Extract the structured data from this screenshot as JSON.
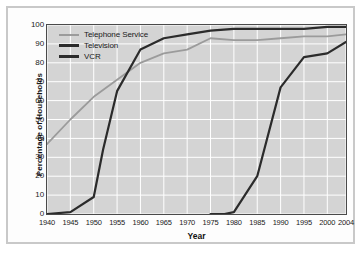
{
  "chart_data": {
    "type": "line",
    "title": "",
    "xlabel": "Year",
    "ylabel": "Percentage of Households",
    "xlim": [
      1940,
      2004
    ],
    "ylim": [
      0,
      100
    ],
    "grid": true,
    "legend_position": "top-left inside plot",
    "x_ticks": [
      "1940",
      "1945",
      "1950",
      "1955",
      "1960",
      "1965",
      "1970",
      "1975",
      "1980",
      "1985",
      "1990",
      "1995",
      "2000",
      "2004"
    ],
    "y_ticks": [
      "0",
      "10",
      "20",
      "30",
      "40",
      "50",
      "60",
      "70",
      "80",
      "90",
      "100"
    ],
    "x": [
      1940,
      1945,
      1950,
      1955,
      1960,
      1965,
      1970,
      1975,
      1980,
      1985,
      1990,
      1995,
      2000,
      2004
    ],
    "series": [
      {
        "name": "Telephone Service",
        "color": "#9b9b9b",
        "width": 1.8,
        "x": [
          1940,
          1945,
          1950,
          1955,
          1960,
          1965,
          1970,
          1975,
          1980,
          1985,
          1990,
          1995,
          2000,
          2004
        ],
        "values": [
          37,
          50,
          62,
          71,
          80,
          85,
          87,
          93,
          92,
          92,
          93,
          94,
          94,
          95
        ]
      },
      {
        "name": "Television",
        "color": "#2b2b2b",
        "width": 2.2,
        "x": [
          1940,
          1945,
          1950,
          1952,
          1955,
          1960,
          1965,
          1970,
          1975,
          1980,
          1985,
          1990,
          1995,
          2000,
          2004
        ],
        "values": [
          0,
          1,
          9,
          34,
          65,
          87,
          93,
          95,
          97,
          98,
          98,
          98,
          98,
          99,
          99
        ]
      },
      {
        "name": "VCR",
        "color": "#2b2b2b",
        "width": 2.2,
        "x": [
          1975,
          1978,
          1980,
          1985,
          1990,
          1995,
          2000,
          2004
        ],
        "values": [
          0,
          0,
          1,
          20,
          67,
          83,
          85,
          91
        ]
      }
    ]
  },
  "legend": {
    "items": [
      {
        "label": "Telephone Service"
      },
      {
        "label": "Television"
      },
      {
        "label": "VCR"
      }
    ]
  },
  "axes": {
    "x_title": "Year",
    "y_title": "Percentage of Households"
  },
  "colors": {
    "plot_background": "#d4d4d4",
    "gridline": "#ffffff",
    "plot_border": "#4a4a4a",
    "outer_frame": "#c9c9c9",
    "page_background": "#ffffff",
    "telephone": "#9b9b9b",
    "television": "#2b2b2b",
    "vcr": "#2b2b2b"
  }
}
